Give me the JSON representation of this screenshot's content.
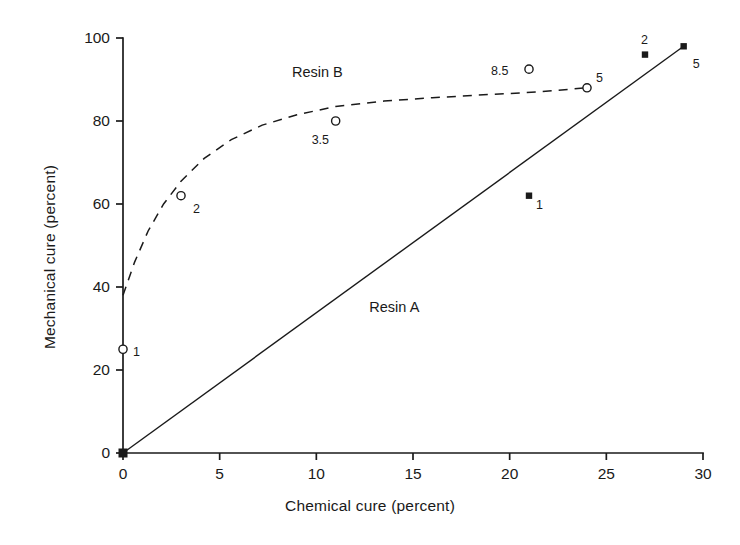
{
  "chart_data": {
    "type": "scatter",
    "title": "",
    "xlabel": "Chemical cure (percent)",
    "ylabel": "Mechanical cure (percent)",
    "xlim": [
      0,
      30
    ],
    "ylim": [
      0,
      100
    ],
    "xticks": [
      "0",
      "5",
      "10",
      "15",
      "20",
      "25",
      "30"
    ],
    "yticks": [
      "0",
      "20",
      "40",
      "60",
      "80",
      "100"
    ],
    "xtick_values": [
      0,
      5,
      10,
      15,
      20,
      25,
      30
    ],
    "ytick_values": [
      0,
      20,
      40,
      60,
      80,
      100
    ],
    "grid": false,
    "legend_position": "inline-annotation",
    "series": [
      {
        "name": "Resin A",
        "marker": "filled-square",
        "line": "solid",
        "annotation": "Resin A",
        "annotation_x": 14.5,
        "annotation_y": 35,
        "x": [
          0,
          21,
          27,
          29
        ],
        "y": [
          0,
          62,
          96,
          98
        ],
        "point_labels": [
          "",
          "1",
          "2",
          "5"
        ],
        "line_x": [
          0,
          29
        ],
        "line_y": [
          0,
          98
        ]
      },
      {
        "name": "Resin B",
        "marker": "open-circle",
        "line": "dashed",
        "annotation": "Resin B",
        "annotation_x": 10.5,
        "annotation_y": 91.5,
        "x": [
          0,
          3,
          11,
          21,
          24
        ],
        "y": [
          25,
          62,
          80,
          92.5,
          88
        ],
        "point_labels": [
          "1",
          "2",
          "3.5",
          "8.5",
          "5"
        ],
        "curve": [
          [
            0.0,
            38.0
          ],
          [
            0.6,
            46.0
          ],
          [
            1.3,
            53.5
          ],
          [
            2.1,
            60.0
          ],
          [
            3.0,
            65.5
          ],
          [
            4.2,
            71.0
          ],
          [
            5.6,
            75.5
          ],
          [
            7.2,
            79.0
          ],
          [
            9.0,
            81.5
          ],
          [
            11.0,
            83.5
          ],
          [
            13.5,
            84.8
          ],
          [
            16.0,
            85.6
          ],
          [
            19.0,
            86.4
          ],
          [
            21.5,
            87.0
          ],
          [
            24.0,
            88.0
          ]
        ]
      }
    ]
  },
  "axes": {
    "x_title": "Chemical cure (percent)",
    "y_title": "Mechanical cure (percent)"
  },
  "annotations": {
    "resin_a": "Resin A",
    "resin_b": "Resin B"
  }
}
